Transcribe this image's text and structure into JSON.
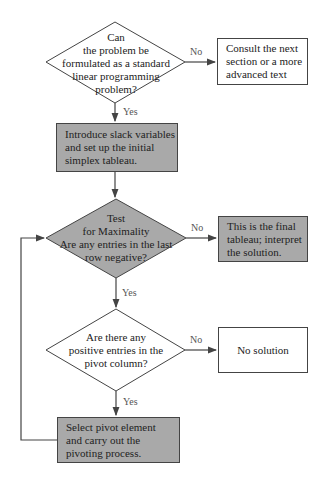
{
  "nodes": {
    "decision_standard": "Can\nthe problem be\nformulated as a standard\nlinear programming\nproblem?",
    "consult": "Consult the next\nsection or a more\nadvanced text",
    "introduce": "Introduce slack variables\nand set up the initial\nsimplex tableau.",
    "test_max": "Test\nfor Maximality\nAre any entries in the last\nrow negative?",
    "final": "This is the final\ntableau; interpret\nthe solution.",
    "positive": "Are there any\npositive entries in the\npivot column?",
    "no_solution": "No solution",
    "pivot": "Select pivot element\nand carry out the\npivoting process."
  },
  "edge_labels": {
    "no1": "No",
    "yes1": "Yes",
    "no2": "No",
    "yes2": "Yes",
    "no3": "No",
    "yes3": "Yes"
  },
  "colors": {
    "gray_fill": "#a9a9a9",
    "line": "#444444"
  }
}
